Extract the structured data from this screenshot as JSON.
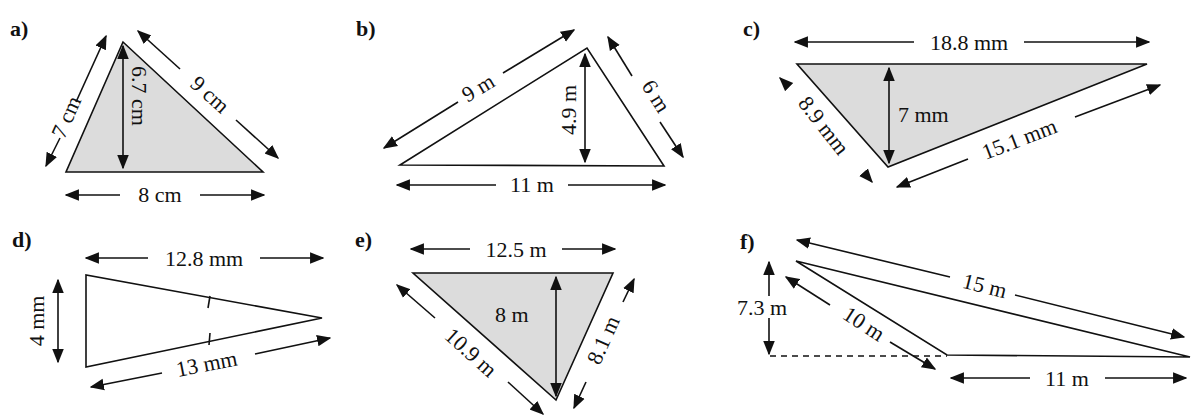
{
  "figure": {
    "background": "#ffffff",
    "shade_color": "#dcdcdc",
    "stroke_color": "#111111"
  },
  "problems": [
    {
      "label": "a)",
      "shaded": true,
      "dimensions": {
        "left_side": "7 cm",
        "right_side": "9 cm",
        "base": "8 cm",
        "height": "6.7 cm"
      }
    },
    {
      "label": "b)",
      "shaded": false,
      "dimensions": {
        "left_side": "9 m",
        "right_side": "6 m",
        "base": "11 m",
        "height": "4.9 m"
      }
    },
    {
      "label": "c)",
      "shaded": true,
      "dimensions": {
        "top": "18.8 mm",
        "left_side": "8.9 mm",
        "right_side": "15.1 mm",
        "height": "7 mm"
      }
    },
    {
      "label": "d)",
      "shaded": false,
      "dimensions": {
        "top": "12.8 mm",
        "bottom": "13 mm",
        "height": "4 mm"
      },
      "note": "equal-side tick marks"
    },
    {
      "label": "e)",
      "shaded": true,
      "dimensions": {
        "top": "12.5 m",
        "left_side": "10.9 m",
        "right_side": "8.1 m",
        "height": "8 m"
      }
    },
    {
      "label": "f)",
      "shaded": false,
      "dimensions": {
        "long_side": "15 m",
        "short_side": "10 m",
        "base": "11 m",
        "height": "7.3 m"
      }
    }
  ]
}
